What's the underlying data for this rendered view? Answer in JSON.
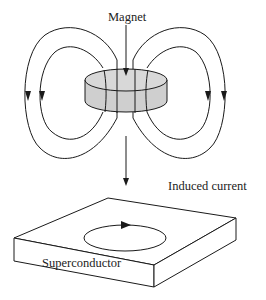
{
  "labels": {
    "magnet": "Magnet",
    "induced_current": "Induced current",
    "superconductor": "Superconductor"
  },
  "colors": {
    "background": "#ffffff",
    "line": "#1a1a1a",
    "magnet_fill": "#cfcfcf",
    "text": "#222222"
  },
  "elements": {
    "magnet": "disc-shaped magnet (cylinder) with field lines",
    "field_lines": [
      "outer-left loop (downward arrow)",
      "inner-left loop (downward arrow)",
      "inner-right loop (downward arrow)",
      "outer-right loop (downward arrow)"
    ],
    "motion_arrow": "downward arrow from magnet toward superconductor",
    "superconductor": "rectangular slab with circular induced current loop (arrow clockwise)"
  }
}
